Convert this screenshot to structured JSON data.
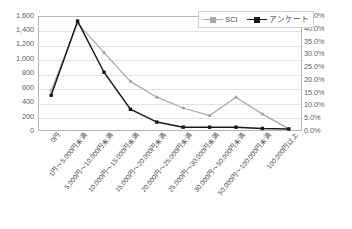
{
  "chart_data": {
    "type": "line",
    "title": "",
    "xlabel": "",
    "grid": true,
    "legend_position": "top-right",
    "categories": [
      "0円",
      "1円～5,000円未満",
      "5,000円～10,000円未満",
      "10,000円～15,000円未満",
      "15,000円～20,000円未満",
      "20,000円～25,000円未満",
      "25,000円～30,000円未満",
      "30,000円～50,000円未満",
      "50,000円～100,000円未満",
      "100,000円以上"
    ],
    "series": [
      {
        "name": "SCI",
        "axis": "left",
        "color": "#a9a9a9",
        "marker": "square",
        "values": [
          560,
          1500,
          1090,
          690,
          470,
          320,
          215,
          470,
          235,
          30
        ]
      },
      {
        "name": "アンケート",
        "axis": "right",
        "color": "#1a1a1a",
        "marker": "square",
        "values": [
          14.0,
          43.0,
          23.0,
          8.5,
          3.5,
          1.5,
          1.5,
          1.5,
          1.0,
          0.8
        ]
      }
    ],
    "left_axis": {
      "label": "",
      "ylim": [
        0,
        1600
      ],
      "tick_step": 200,
      "ticks": [
        "1,600",
        "1,400",
        "1,200",
        "1,000",
        "800",
        "600",
        "400",
        "200",
        "0"
      ]
    },
    "right_axis": {
      "label": "",
      "ylim": [
        0,
        45
      ],
      "tick_step": 5,
      "ticks": [
        "45.0%",
        "40.0%",
        "35.0%",
        "30.0%",
        "25.0%",
        "20.0%",
        "15.0%",
        "10.0%",
        "5.0%",
        "0.0%"
      ]
    }
  },
  "legend": {
    "entries": [
      {
        "label": "SCI",
        "color": "#a9a9a9"
      },
      {
        "label": "アンケート",
        "color": "#1a1a1a"
      }
    ]
  },
  "caption": {
    "text": ""
  }
}
